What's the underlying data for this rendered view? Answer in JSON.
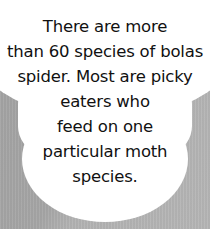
{
  "callout": {
    "lines": [
      "There are more",
      "than 60 species of bolas",
      "spider. Most are picky",
      "eaters who",
      "feed on one",
      "particular moth",
      "species."
    ]
  },
  "colors": {
    "background": "#a9a9a9",
    "bubble": "#ffffff",
    "text": "#111111"
  }
}
